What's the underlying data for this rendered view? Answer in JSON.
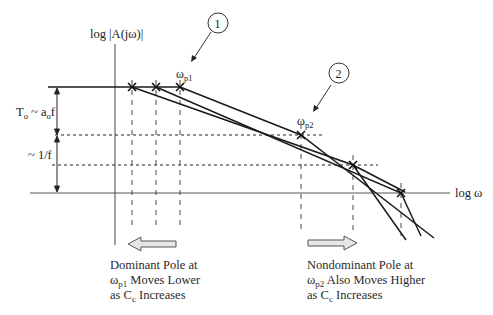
{
  "diagram": {
    "type": "bode-magnitude-pole-splitting",
    "y_axis_label": "log |A(jω)|",
    "x_axis_label": "log ω",
    "callouts": [
      {
        "id": "1",
        "label": "1",
        "points_to": "ω_p1"
      },
      {
        "id": "2",
        "label": "2",
        "points_to": "ω_p2"
      }
    ],
    "pole_labels": {
      "p1": {
        "base": "ω",
        "sub": "p1"
      },
      "p2": {
        "base": "ω",
        "sub": "p2"
      }
    },
    "left_annotations": {
      "upper": {
        "text": "T",
        "sub_o": "o",
        "tail": " ~ a",
        "sub_o2": "o",
        "tail2": "f"
      },
      "lower": "~ 1/f"
    },
    "captions": {
      "left": {
        "line1": "Dominant Pole at",
        "line2_base": "ω",
        "line2_sub": "p1",
        "line2_tail": " Moves Lower",
        "line3_head": "as C",
        "line3_sub": "c",
        "line3_tail": " Increases",
        "arrow_direction": "left"
      },
      "right": {
        "line1": "Nondominant Pole at",
        "line2_base": "ω",
        "line2_sub": "p2",
        "line2_tail": " Also Moves Higher",
        "line3_head": "as C",
        "line3_sub": "c",
        "line3_tail": " Increases",
        "arrow_direction": "right"
      }
    },
    "colors": {
      "line": "#1a1a1a",
      "axis": "#444444",
      "dashed": "#333333",
      "arrow_fill": "#e6e6e6",
      "arrow_stroke": "#555555"
    }
  }
}
